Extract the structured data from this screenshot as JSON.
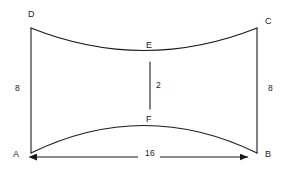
{
  "figure": {
    "background_color": "#ffffff",
    "stroke_color": "#1a1a1a",
    "vertices": [
      {
        "name": "D",
        "label": "D",
        "x": 31,
        "y": 28
      },
      {
        "name": "C",
        "label": "C",
        "x": 257,
        "y": 28
      },
      {
        "name": "A",
        "label": "A",
        "x": 31,
        "y": 153
      },
      {
        "name": "B",
        "label": "B",
        "x": 257,
        "y": 153
      },
      {
        "name": "E",
        "label": "E",
        "x": 150,
        "y": 62
      },
      {
        "name": "F",
        "label": "F",
        "x": 150,
        "y": 109
      }
    ],
    "measurements": {
      "left_side": "8",
      "right_side": "8",
      "middle_segment": "2",
      "base": "16"
    }
  }
}
